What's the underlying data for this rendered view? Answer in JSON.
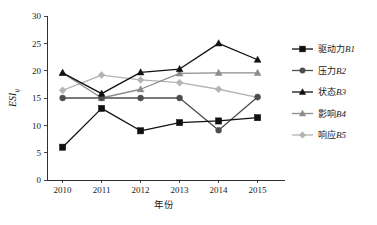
{
  "chart_data": {
    "type": "line",
    "title": "",
    "xlabel": "年份",
    "ylabel": "ESI",
    "ylabel_sub": "ij",
    "x": [
      2010,
      2011,
      2012,
      2013,
      2014,
      2015
    ],
    "categories": [
      "2010",
      "2011",
      "2012",
      "2013",
      "2014",
      "2015"
    ],
    "xlim": [
      2009.6,
      2015.6
    ],
    "ylim": [
      0,
      30
    ],
    "yticks": [
      0,
      5,
      10,
      15,
      20,
      25,
      30
    ],
    "ytick_labels": [
      "0",
      "5",
      "10",
      "15",
      "20",
      "25",
      "30"
    ],
    "grid": false,
    "legend_position": "right",
    "series": [
      {
        "name": "驱动力B1",
        "label_cn": "驱动力",
        "label_code": "B1",
        "marker": "square",
        "color": "#111111",
        "values": [
          6.0,
          13.1,
          9.0,
          10.5,
          10.8,
          11.4
        ]
      },
      {
        "name": "压力B2",
        "label_cn": "压力",
        "label_code": "B2",
        "marker": "circle",
        "color": "#4d4d4d",
        "values": [
          15.0,
          15.0,
          15.0,
          15.0,
          9.1,
          15.2
        ]
      },
      {
        "name": "状态B3",
        "label_cn": "状态",
        "label_code": "B3",
        "marker": "triangle",
        "color": "#111111",
        "values": [
          19.6,
          15.8,
          19.7,
          20.3,
          25.0,
          22.0
        ]
      },
      {
        "name": "影响B4",
        "label_cn": "影响",
        "label_code": "B4",
        "marker": "triangle",
        "color": "#8c8c8c",
        "values": [
          19.6,
          15.0,
          16.6,
          19.5,
          19.6,
          19.6
        ]
      },
      {
        "name": "响应B5",
        "label_cn": "响应",
        "label_code": "B5",
        "marker": "diamond",
        "color": "#b3b3b3",
        "values": [
          16.4,
          19.2,
          18.3,
          17.8,
          16.6,
          15.1
        ]
      }
    ]
  }
}
